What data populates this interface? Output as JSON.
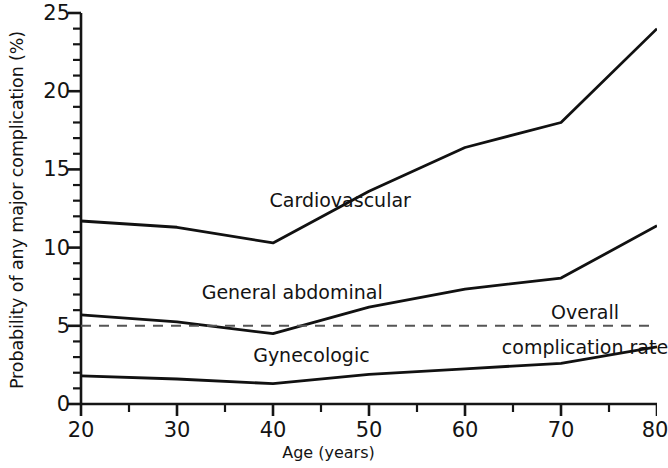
{
  "chart_data": {
    "type": "line",
    "title": "",
    "xlabel": "Age (years)",
    "ylabel": "Probability of any major complication (%)",
    "xlim": [
      20,
      80
    ],
    "ylim": [
      0,
      25
    ],
    "xticks": [
      20,
      30,
      40,
      50,
      60,
      70,
      80
    ],
    "xticklabels": [
      "20",
      "30",
      "40",
      "50",
      "60",
      "70",
      "80"
    ],
    "xminor_step": 5,
    "yticks": [
      0,
      5,
      10,
      15,
      20,
      25
    ],
    "yticklabels": [
      "0",
      "5",
      "10",
      "15",
      "20",
      "25"
    ],
    "yminor_step": 1,
    "grid": false,
    "legend_position": "inline-labels",
    "x": [
      20,
      30,
      40,
      50,
      60,
      70,
      80
    ],
    "series": [
      {
        "name": "Cardiovascular",
        "style": "solid",
        "color": "#111111",
        "values": [
          11.7,
          11.3,
          10.3,
          13.6,
          16.4,
          18.0,
          24.0
        ],
        "label_x": 47,
        "label_y": 13.0
      },
      {
        "name": "General abdominal",
        "style": "solid",
        "color": "#111111",
        "values": [
          5.7,
          5.25,
          4.5,
          6.2,
          7.35,
          8.05,
          11.4
        ],
        "label_x": 42,
        "label_y": 7.1
      },
      {
        "name": "Gynecologic",
        "style": "solid",
        "color": "#111111",
        "values": [
          1.8,
          1.6,
          1.3,
          1.9,
          2.25,
          2.6,
          3.65
        ],
        "label_x": 44,
        "label_y": 3.1
      },
      {
        "name": "Overall complication rate",
        "style": "dashed",
        "color": "#555555",
        "values": [
          5.0,
          5.0,
          5.0,
          5.0,
          5.0,
          5.0,
          5.0
        ],
        "label_line1": "Overall",
        "label_line2": "complication rate",
        "label_x": 72.5,
        "label_y": 5.0
      }
    ],
    "annotations": [
      {
        "text": "Cardiovascular",
        "x": 47,
        "y": 13.0
      },
      {
        "text": "General abdominal",
        "x": 42,
        "y": 7.1
      },
      {
        "text": "Gynecologic",
        "x": 44,
        "y": 3.1
      },
      {
        "text": "Overall",
        "x": 72.5,
        "y": 6.1
      },
      {
        "text": "complication rate",
        "x": 72.5,
        "y": 4.0
      }
    ]
  }
}
